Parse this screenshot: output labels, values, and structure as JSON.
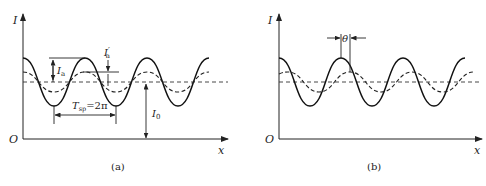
{
  "panels": [
    {
      "id": "a",
      "caption": "(a)",
      "y_axis_label": "I",
      "x_axis_label": "x",
      "origin_label": "O",
      "annotations": {
        "amplitude_solid": "I",
        "amplitude_solid_sub": "a",
        "amplitude_dashed": "I",
        "amplitude_dashed_sub": "a",
        "amplitude_dashed_prime": "′",
        "period": "T",
        "period_sub": "sp",
        "period_value": "=2π",
        "mean_level": "I",
        "mean_level_sub": "0"
      }
    },
    {
      "id": "b",
      "caption": "(b)",
      "y_axis_label": "I",
      "x_axis_label": "x",
      "origin_label": "O",
      "annotations": {
        "phase_shift": "θ"
      }
    }
  ],
  "curves": {
    "solid": "light intensity (solid sinusoid, large amplitude)",
    "dashed": "light intensity (dashed sinusoid, reduced amplitude)",
    "mean": "mean intensity I0 (horizontal dashed line)"
  }
}
